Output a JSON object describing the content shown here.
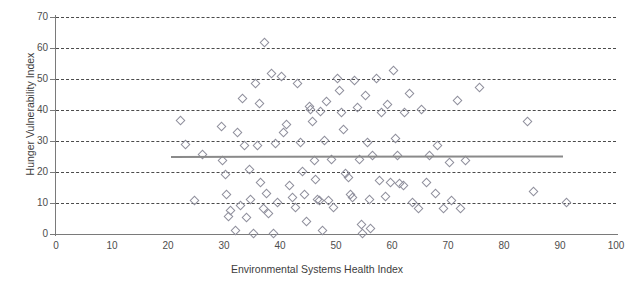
{
  "chart_data": {
    "type": "scatter",
    "title": "",
    "xlabel": "Environmental Systems Health Index",
    "ylabel": "Hunger Vulnerability Index",
    "xlim": [
      0,
      100
    ],
    "ylim": [
      0,
      70
    ],
    "xticks": [
      0,
      10,
      20,
      30,
      40,
      50,
      60,
      70,
      80,
      90,
      100
    ],
    "yticks": [
      0,
      10,
      20,
      30,
      40,
      50,
      60,
      70
    ],
    "grid": "horizontal-dashed",
    "legend": "none",
    "marker": "open-diamond",
    "marker_color": "#8f8f9c",
    "trendline": {
      "type": "linear-fit",
      "color": "#8a8a8a",
      "x_start": 20.5,
      "x_end": 90.5,
      "y_start": 25.2,
      "y_end": 25.4
    },
    "points": [
      {
        "x": 22.0,
        "y": 37.0
      },
      {
        "x": 23.0,
        "y": 29.3
      },
      {
        "x": 24.5,
        "y": 11.0
      },
      {
        "x": 26.0,
        "y": 26.0
      },
      {
        "x": 29.3,
        "y": 35.0
      },
      {
        "x": 29.6,
        "y": 24.0
      },
      {
        "x": 30.0,
        "y": 19.5
      },
      {
        "x": 30.3,
        "y": 13.0
      },
      {
        "x": 30.6,
        "y": 6.0
      },
      {
        "x": 31.0,
        "y": 7.8
      },
      {
        "x": 31.8,
        "y": 1.5
      },
      {
        "x": 32.2,
        "y": 33.0
      },
      {
        "x": 32.8,
        "y": 9.5
      },
      {
        "x": 33.2,
        "y": 44.0
      },
      {
        "x": 33.5,
        "y": 29.0
      },
      {
        "x": 33.8,
        "y": 5.5
      },
      {
        "x": 34.3,
        "y": 21.0
      },
      {
        "x": 34.6,
        "y": 11.5
      },
      {
        "x": 35.0,
        "y": 0.5
      },
      {
        "x": 35.4,
        "y": 49.0
      },
      {
        "x": 35.8,
        "y": 29.0
      },
      {
        "x": 36.2,
        "y": 42.5
      },
      {
        "x": 36.4,
        "y": 17.0
      },
      {
        "x": 36.8,
        "y": 8.5
      },
      {
        "x": 37.0,
        "y": 62.0
      },
      {
        "x": 37.4,
        "y": 13.5
      },
      {
        "x": 37.8,
        "y": 7.0
      },
      {
        "x": 38.3,
        "y": 52.0
      },
      {
        "x": 38.6,
        "y": 0.5
      },
      {
        "x": 39.0,
        "y": 29.5
      },
      {
        "x": 39.4,
        "y": 10.5
      },
      {
        "x": 40.0,
        "y": 51.0
      },
      {
        "x": 40.5,
        "y": 33.0
      },
      {
        "x": 41.0,
        "y": 35.5
      },
      {
        "x": 41.5,
        "y": 16.0
      },
      {
        "x": 42.0,
        "y": 12.0
      },
      {
        "x": 42.6,
        "y": 9.0
      },
      {
        "x": 43.0,
        "y": 49.0
      },
      {
        "x": 43.4,
        "y": 30.0
      },
      {
        "x": 43.8,
        "y": 20.5
      },
      {
        "x": 44.2,
        "y": 13.0
      },
      {
        "x": 44.6,
        "y": 4.5
      },
      {
        "x": 45.0,
        "y": 41.5
      },
      {
        "x": 45.3,
        "y": 40.5
      },
      {
        "x": 45.6,
        "y": 36.5
      },
      {
        "x": 46.0,
        "y": 24.0
      },
      {
        "x": 46.2,
        "y": 18.0
      },
      {
        "x": 46.5,
        "y": 11.5
      },
      {
        "x": 46.8,
        "y": 11.0
      },
      {
        "x": 47.0,
        "y": 40.0
      },
      {
        "x": 47.4,
        "y": 1.5
      },
      {
        "x": 47.8,
        "y": 30.5
      },
      {
        "x": 48.2,
        "y": 43.0
      },
      {
        "x": 48.5,
        "y": 11.0
      },
      {
        "x": 49.0,
        "y": 24.5
      },
      {
        "x": 49.4,
        "y": 9.0
      },
      {
        "x": 50.0,
        "y": 50.5
      },
      {
        "x": 50.4,
        "y": 46.5
      },
      {
        "x": 50.8,
        "y": 39.5
      },
      {
        "x": 51.2,
        "y": 34.0
      },
      {
        "x": 51.6,
        "y": 20.0
      },
      {
        "x": 52.0,
        "y": 18.5
      },
      {
        "x": 52.4,
        "y": 13.0
      },
      {
        "x": 52.8,
        "y": 12.0
      },
      {
        "x": 53.2,
        "y": 50.0
      },
      {
        "x": 53.6,
        "y": 41.0
      },
      {
        "x": 54.0,
        "y": 24.5
      },
      {
        "x": 54.4,
        "y": 3.5
      },
      {
        "x": 54.6,
        "y": 0.5
      },
      {
        "x": 55.0,
        "y": 45.0
      },
      {
        "x": 55.4,
        "y": 30.0
      },
      {
        "x": 55.8,
        "y": 11.5
      },
      {
        "x": 56.0,
        "y": 2.0
      },
      {
        "x": 56.4,
        "y": 25.5
      },
      {
        "x": 57.0,
        "y": 50.5
      },
      {
        "x": 57.5,
        "y": 17.5
      },
      {
        "x": 58.0,
        "y": 39.5
      },
      {
        "x": 58.6,
        "y": 12.5
      },
      {
        "x": 59.0,
        "y": 42.0
      },
      {
        "x": 59.5,
        "y": 17.0
      },
      {
        "x": 60.0,
        "y": 53.0
      },
      {
        "x": 60.4,
        "y": 31.0
      },
      {
        "x": 60.8,
        "y": 25.5
      },
      {
        "x": 61.2,
        "y": 16.5
      },
      {
        "x": 61.8,
        "y": 16.0
      },
      {
        "x": 62.0,
        "y": 39.5
      },
      {
        "x": 63.0,
        "y": 45.5
      },
      {
        "x": 63.5,
        "y": 10.5
      },
      {
        "x": 64.5,
        "y": 8.5
      },
      {
        "x": 65.0,
        "y": 40.5
      },
      {
        "x": 66.0,
        "y": 17.0
      },
      {
        "x": 66.5,
        "y": 25.5
      },
      {
        "x": 67.5,
        "y": 13.5
      },
      {
        "x": 68.0,
        "y": 29.0
      },
      {
        "x": 69.0,
        "y": 8.5
      },
      {
        "x": 70.0,
        "y": 23.5
      },
      {
        "x": 70.5,
        "y": 11.0
      },
      {
        "x": 71.5,
        "y": 43.5
      },
      {
        "x": 72.0,
        "y": 8.5
      },
      {
        "x": 73.0,
        "y": 24.0
      },
      {
        "x": 75.5,
        "y": 47.5
      },
      {
        "x": 84.0,
        "y": 36.5
      },
      {
        "x": 85.0,
        "y": 14.0
      },
      {
        "x": 91.0,
        "y": 10.5
      }
    ]
  }
}
